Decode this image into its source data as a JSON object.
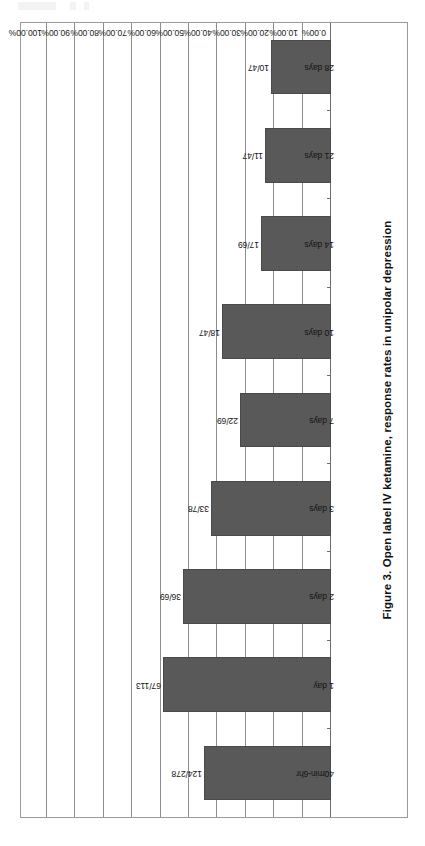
{
  "figure": {
    "title": "Figure 3. Open label IV ketamine, response rates in unipolar depression"
  },
  "axis": {
    "tick_labels": [
      "0.00%",
      "10.00%",
      "20.00%",
      "30.00%",
      "40.00%",
      "50.00%",
      "60.00%",
      "70.00%",
      "80.00%",
      "90.00%",
      "100.00%"
    ]
  },
  "colors": {
    "bar_fill": "#595959",
    "bar_stroke": "#4a4a4a",
    "gridline": "#8d8d8d",
    "axis": "#6e6e6e",
    "frame": "#9a9a9a",
    "text": "#141414"
  },
  "chart_data": {
    "type": "bar",
    "orientation": "horizontal",
    "title": "Figure 3. Open label IV ketamine, response rates in unipolar depression",
    "xlabel": "",
    "ylabel": "",
    "categories": [
      "40min-6hr",
      "1 day",
      "2 days",
      "3 days",
      "7 days",
      "10 days",
      "14 days",
      "21 days",
      "28 days"
    ],
    "values": [
      44.6,
      59.3,
      52.2,
      42.3,
      31.9,
      38.3,
      24.6,
      23.4,
      21.3
    ],
    "data_labels": [
      "124/278",
      "67/113",
      "36/69",
      "33/78",
      "22/69",
      "18/47",
      "17/69",
      "11/47",
      "10/47"
    ],
    "numerators": [
      124,
      67,
      36,
      33,
      22,
      18,
      17,
      11,
      10
    ],
    "denominators": [
      278,
      113,
      69,
      78,
      69,
      47,
      69,
      47,
      47
    ],
    "ylim": [
      0,
      100
    ],
    "tick_step": 10,
    "tick_labels": [
      "0.00%",
      "10.00%",
      "20.00%",
      "30.00%",
      "40.00%",
      "50.00%",
      "60.00%",
      "70.00%",
      "80.00%",
      "90.00%",
      "100.00%"
    ],
    "value_unit": "percent",
    "grid": true,
    "legend": false
  }
}
